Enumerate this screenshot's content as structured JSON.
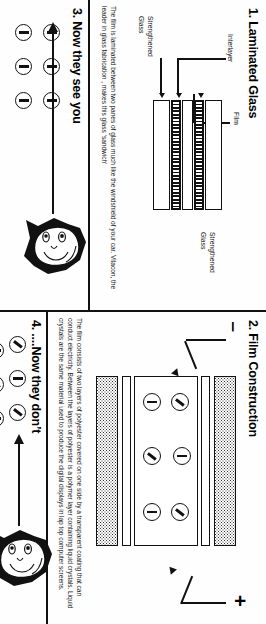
{
  "figure": {
    "orientation": "rotated-90-ccw-scan",
    "ink_color": "#111111",
    "paper_color": "#ffffff"
  },
  "panels": {
    "laminated_glass": {
      "number": "1.",
      "title": "1. Laminated Glass",
      "labels": {
        "film": "Film",
        "interlayer": "Interlayer",
        "glass_top": "Strengthened\nGlass",
        "glass_bottom": "Strengthened\nGlass"
      },
      "body": "The film is laminated between two panes of glass much like the windshield of your car. Vitacon, the leader in glass fabrication , makes this glass ‘sandwich’",
      "body_lines": [
        "The film is laminated between two panes of glass",
        "much like the windshield of your car. Vitacon, the leader in",
        "glass fabrication , makes this glass ‘sandwich’"
      ],
      "stack_layers": [
        "Strengthened Glass",
        "Interlayer",
        "Film",
        "Interlayer",
        "Strengthened Glass"
      ]
    },
    "film_construction": {
      "number": "2.",
      "title": "2. Film Construction",
      "terminal_negative": "‒",
      "terminal_positive": "+",
      "body": "The film consists of two layers of polyester covered on one side by a transparent coating that can conduct electricity. Between the layers of polyester is a polymer layer containing liquid crystals. Liquid crystals are the same material used to produce the digital displays in lap top computer screens.",
      "body_lines": [
        "The film consists of two layers of polyester covered on one side by a",
        "transparent coating that can conduct electricity.  Between the layers of polyester",
        "is a polymer layer containing liquid crystals. Liquid crystals are the same",
        "material used to produce the digital displays in lap top computer screens."
      ],
      "stack_layers": [
        "polyester",
        "conductive coating",
        "liquid crystal polymer layer",
        "conductive coating",
        "polyester"
      ],
      "crystal_count": 6
    },
    "now_they_see_you": {
      "number": "3.",
      "title": "3. Now they see you",
      "crystal_count": 6,
      "crystal_state": "aligned",
      "ray_direction": "toward-viewer-left",
      "viewer": "face-looking-left"
    },
    "now_they_dont": {
      "number": "4.",
      "title": "4. ....Now they don’t",
      "crystal_count": 6,
      "crystal_state": "randomly-oriented",
      "ray_direction": "blocked",
      "viewer": "face-looking-left"
    }
  }
}
